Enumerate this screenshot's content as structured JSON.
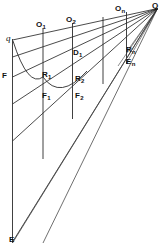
{
  "figure": {
    "type": "geometric-line-diagram",
    "width": 164,
    "height": 249,
    "background_color": "#ffffff",
    "line_color": "#2b2b2b",
    "label_color": "#111111"
  },
  "labels": [
    {
      "id": "q-italic",
      "text": "q",
      "sub": "",
      "x": 6,
      "y": 36,
      "style": "italic"
    },
    {
      "id": "O1",
      "text": "O",
      "sub": "1",
      "x": 36,
      "y": 22,
      "style": "bold"
    },
    {
      "id": "O2",
      "text": "O",
      "sub": "2",
      "x": 66,
      "y": 17,
      "style": "bold"
    },
    {
      "id": "On",
      "text": "O",
      "sub": "n",
      "x": 116,
      "y": 5,
      "style": "bold"
    },
    {
      "id": "Q",
      "text": "Q",
      "sub": "",
      "x": 152,
      "y": 2,
      "style": "bold"
    },
    {
      "id": "D1",
      "text": "D",
      "sub": "1",
      "x": 73,
      "y": 49,
      "style": "bold"
    },
    {
      "id": "Rn",
      "text": "R",
      "sub": "n",
      "x": 126,
      "y": 47,
      "style": "bold"
    },
    {
      "id": "En",
      "text": "E",
      "sub": "n",
      "x": 126,
      "y": 59,
      "style": "bold"
    },
    {
      "id": "F",
      "text": "F",
      "sub": "",
      "x": 2,
      "y": 72,
      "style": "bold"
    },
    {
      "id": "R1",
      "text": "R",
      "sub": "1",
      "x": 42,
      "y": 71,
      "style": "bold"
    },
    {
      "id": "R2",
      "text": "R",
      "sub": "2",
      "x": 75,
      "y": 75,
      "style": "bold"
    },
    {
      "id": "F1",
      "text": "F",
      "sub": "1",
      "x": 42,
      "y": 92,
      "style": "bold"
    },
    {
      "id": "F2",
      "text": "F",
      "sub": "2",
      "x": 75,
      "y": 92,
      "style": "bold"
    },
    {
      "id": "E",
      "text": "E",
      "sub": "",
      "x": 9,
      "y": 236,
      "style": "bold"
    }
  ],
  "geometry": {
    "apex": {
      "name": "Q",
      "x": 157.5,
      "y": 8.5
    },
    "vertical_lines": [
      {
        "name": "axis-left",
        "x": 12.5,
        "y1": 40,
        "y2": 242
      },
      {
        "name": "ordinate-1",
        "x": 43.0,
        "y1": 29,
        "y2": 158
      },
      {
        "name": "ordinate-2",
        "x": 72.5,
        "y1": 24,
        "y2": 118
      },
      {
        "name": "ordinate-3",
        "x": 103.0,
        "y1": 18,
        "y2": 83
      },
      {
        "name": "ordinate-n",
        "x": 126.5,
        "y1": 13,
        "y2": 63
      }
    ],
    "rays_from_apex": [
      {
        "name": "ray-O",
        "x2": 12.5,
        "y2": 40
      },
      {
        "name": "ray-D",
        "x2": 12.5,
        "y2": 57
      },
      {
        "name": "ray-R",
        "x2": 12.5,
        "y2": 77
      },
      {
        "name": "ray-F",
        "x2": 12.5,
        "y2": 104
      },
      {
        "name": "ray-G",
        "x2": 12.5,
        "y2": 141
      },
      {
        "name": "ray-E",
        "x2": 12.5,
        "y2": 242
      }
    ],
    "arcs": [
      {
        "name": "arc-1",
        "x1": 13,
        "y1": 41,
        "cx": 28,
        "cy": 86,
        "x2": 43,
        "y2": 77
      },
      {
        "name": "arc-2",
        "x1": 43,
        "y1": 77,
        "cx": 58,
        "cy": 100,
        "x2": 86,
        "y2": 72
      }
    ],
    "cross_rays": [
      {
        "name": "cross-ray-1",
        "x1": 12.5,
        "y1": 243,
        "x2": 157.5,
        "y2": 8.5
      },
      {
        "name": "cross-ray-2",
        "x1": 43.0,
        "y1": 243,
        "x2": 157.5,
        "y2": 8.5
      }
    ]
  }
}
